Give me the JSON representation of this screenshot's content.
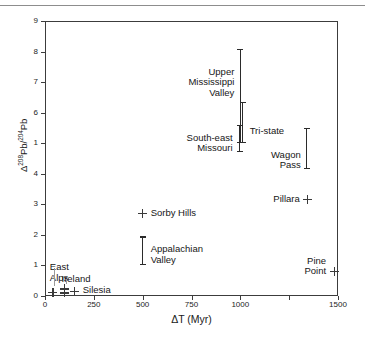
{
  "figure": {
    "has_top_rule": true,
    "background": "#ffffff",
    "ink_color": "#2b2b2b"
  },
  "chart_data": {
    "type": "scatter",
    "title": "",
    "xlabel": "ΔT (Myr)",
    "ylabel": "Δ 208Pb/204Pb",
    "ylabel_parts": {
      "delta": "Δ",
      "num_sup": "208",
      "num": "Pb",
      "slash": "/",
      "den_sup": "204",
      "den": "Pb"
    },
    "xlim": [
      0,
      1500
    ],
    "ylim": [
      0,
      9
    ],
    "grid": false,
    "legend": "none",
    "x_ticks": [
      0,
      250,
      500,
      750,
      1000,
      1250,
      1500
    ],
    "x_tick_labels": [
      "0",
      "250",
      "500",
      "750",
      "1000",
      "",
      "1500"
    ],
    "y_ticks": [
      0,
      1,
      2,
      3,
      4,
      5,
      6,
      7,
      8,
      9
    ],
    "y_tick_labels": [
      "0",
      "1",
      "2",
      "3",
      "4",
      "1",
      "6",
      "7",
      "8",
      "9"
    ],
    "ranges": [
      {
        "name": "Upper Mississippi Valley",
        "x": 1000,
        "y_low": 5.0,
        "y_high": 8.1,
        "label": "Upper\nMississippi\nValley",
        "label_lines": [
          "Upper",
          "Mississippi",
          "Valley"
        ]
      },
      {
        "name": "Tri-state",
        "x": 1012,
        "y_low": 5.0,
        "y_high": 6.35,
        "label": "Tri-state",
        "label_lines": [
          "Tri-state"
        ]
      },
      {
        "name": "South-east Missouri",
        "x": 996,
        "y_low": 4.7,
        "y_high": 5.6,
        "label": "South-east\nMissouri",
        "label_lines": [
          "South-east",
          "Missouri"
        ]
      },
      {
        "name": "Wagon Pass",
        "x": 1340,
        "y_low": 4.15,
        "y_high": 5.5,
        "label": "Wagon\nPass",
        "label_lines": [
          "Wagon",
          "Pass"
        ]
      },
      {
        "name": "Appalachian Valley",
        "x": 500,
        "y_low": 1.0,
        "y_high": 1.95,
        "label": "Appalachian\nValley",
        "label_lines": [
          "Appalachian",
          "Valley"
        ]
      }
    ],
    "points": [
      {
        "name": "East Alps",
        "x": 40,
        "y": 0.12,
        "label": "East\nAlps",
        "label_lines": [
          "East",
          "Alps"
        ],
        "has_leader": true
      },
      {
        "name": "Ireland",
        "x": 100,
        "y": 0.1,
        "label": "Ireland",
        "label_lines": [
          "Ireland"
        ],
        "has_leader": true
      },
      {
        "name": "Silesia",
        "x": 152,
        "y": 0.15,
        "label": "Silesia",
        "label_lines": [
          "Silesia"
        ],
        "has_leader": false
      },
      {
        "name": "Sorby Hills",
        "x": 500,
        "y": 2.7,
        "label": "Sorby Hills",
        "label_lines": [
          "Sorby Hills"
        ],
        "has_leader": false
      },
      {
        "name": "Pillara",
        "x": 1345,
        "y": 3.15,
        "label": "Pillara",
        "label_lines": [
          "Pillara"
        ],
        "has_leader": false
      },
      {
        "name": "Pine Point",
        "x": 1480,
        "y": 0.8,
        "label": "Pine\nPoint",
        "label_lines": [
          "Pine",
          "Point"
        ],
        "has_leader": false
      }
    ]
  },
  "labels": {
    "upper_mississippi_valley": {
      "l1": "Upper",
      "l2": "Mississippi",
      "l3": "Valley"
    },
    "tri_state": {
      "l1": "Tri-state"
    },
    "south_east_missouri": {
      "l1": "South-east",
      "l2": "Missouri"
    },
    "wagon_pass": {
      "l1": "Wagon",
      "l2": "Pass"
    },
    "appalachian_valley": {
      "l1": "Appalachian",
      "l2": "Valley"
    },
    "east_alps": {
      "l1": "East",
      "l2": "Alps"
    },
    "ireland": {
      "l1": "Ireland"
    },
    "silesia": {
      "l1": "Silesia"
    },
    "sorby_hills": {
      "l1": "Sorby Hills"
    },
    "pillara": {
      "l1": "Pillara"
    },
    "pine_point": {
      "l1": "Pine",
      "l2": "Point"
    }
  }
}
